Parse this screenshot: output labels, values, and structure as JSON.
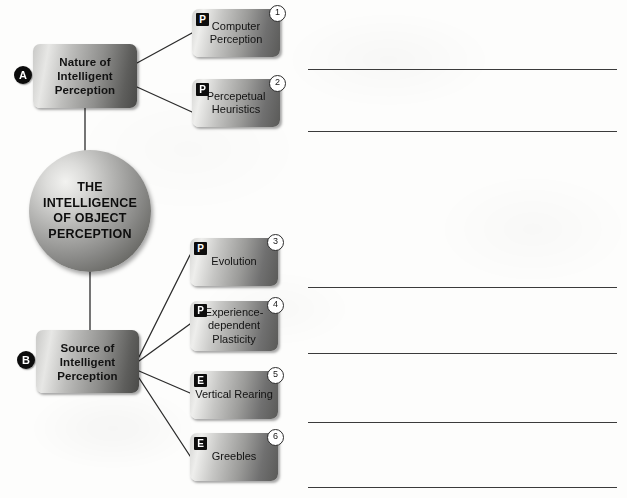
{
  "diagram": {
    "type": "concept-map",
    "center": {
      "id": "center",
      "label": "THE INTELLIGENCE OF OBJECT PERCEPTION",
      "shape": "circle"
    },
    "sections": [
      {
        "badge": "A",
        "label": "Nature of Intelligent Perception",
        "branches": [
          {
            "number": "1",
            "tag": "P",
            "label": "Computer Perception"
          },
          {
            "number": "2",
            "tag": "P",
            "label": "Percepetual Heuristics"
          }
        ]
      },
      {
        "badge": "B",
        "label": "Source of Intelligent Perception",
        "branches": [
          {
            "number": "3",
            "tag": "P",
            "label": "Evolution"
          },
          {
            "number": "4",
            "tag": "P",
            "label": "Experience-dependent Plasticity"
          },
          {
            "number": "5",
            "tag": "E",
            "label": "Vertical Rearing"
          },
          {
            "number": "6",
            "tag": "E",
            "label": "Greebles"
          }
        ]
      }
    ]
  },
  "notes": {
    "line_count": 6,
    "lines": [
      "",
      "",
      "",
      "",
      "",
      ""
    ]
  },
  "colors": {
    "page_background": "#fdfdfc",
    "box_fill_light": "#eeeeec",
    "box_fill_dark": "#4a4a48",
    "badge_fill": "#0c0c0c",
    "badge_text": "#ffffff",
    "connector_stroke": "#2c2c2c",
    "rule_stroke": "#3b3b3b",
    "text": "#121212"
  }
}
